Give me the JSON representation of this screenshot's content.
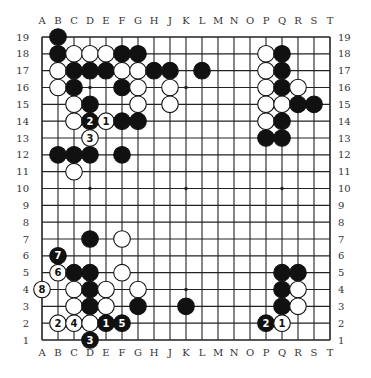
{
  "diagram": {
    "type": "go-board",
    "size": 19,
    "column_labels": [
      "A",
      "B",
      "C",
      "D",
      "E",
      "F",
      "G",
      "H",
      "J",
      "K",
      "L",
      "M",
      "N",
      "O",
      "P",
      "Q",
      "R",
      "S",
      "T"
    ],
    "row_labels": [
      "19",
      "18",
      "17",
      "16",
      "15",
      "14",
      "13",
      "12",
      "11",
      "10",
      "9",
      "8",
      "7",
      "6",
      "5",
      "4",
      "3",
      "2",
      "1"
    ],
    "star_points": [
      "D16",
      "K16",
      "Q16",
      "D10",
      "K10",
      "Q10",
      "D4",
      "K4",
      "Q4"
    ],
    "colors": {
      "black": "#111111",
      "white": "#ffffff",
      "line": "#222222",
      "background": "#ffffff"
    },
    "stones": [
      {
        "pt": "B19",
        "c": "B"
      },
      {
        "pt": "B18",
        "c": "B"
      },
      {
        "pt": "C18",
        "c": "W"
      },
      {
        "pt": "D18",
        "c": "W"
      },
      {
        "pt": "E18",
        "c": "W"
      },
      {
        "pt": "F18",
        "c": "B"
      },
      {
        "pt": "G18",
        "c": "B"
      },
      {
        "pt": "B17",
        "c": "W"
      },
      {
        "pt": "C17",
        "c": "B"
      },
      {
        "pt": "D17",
        "c": "B"
      },
      {
        "pt": "E17",
        "c": "B"
      },
      {
        "pt": "F17",
        "c": "W"
      },
      {
        "pt": "G17",
        "c": "W"
      },
      {
        "pt": "H17",
        "c": "B"
      },
      {
        "pt": "J17",
        "c": "B"
      },
      {
        "pt": "L17",
        "c": "B"
      },
      {
        "pt": "B16",
        "c": "W"
      },
      {
        "pt": "C16",
        "c": "B"
      },
      {
        "pt": "F16",
        "c": "B"
      },
      {
        "pt": "G16",
        "c": "W"
      },
      {
        "pt": "J16",
        "c": "W"
      },
      {
        "pt": "C15",
        "c": "W"
      },
      {
        "pt": "D15",
        "c": "B"
      },
      {
        "pt": "G15",
        "c": "W"
      },
      {
        "pt": "J15",
        "c": "W"
      },
      {
        "pt": "C14",
        "c": "W"
      },
      {
        "pt": "D14",
        "c": "B",
        "label": "2"
      },
      {
        "pt": "E14",
        "c": "W",
        "label": "1"
      },
      {
        "pt": "F14",
        "c": "B"
      },
      {
        "pt": "G14",
        "c": "B"
      },
      {
        "pt": "D13",
        "c": "W",
        "label": "3"
      },
      {
        "pt": "B12",
        "c": "B"
      },
      {
        "pt": "C12",
        "c": "B"
      },
      {
        "pt": "D12",
        "c": "B"
      },
      {
        "pt": "F12",
        "c": "B"
      },
      {
        "pt": "C11",
        "c": "W"
      },
      {
        "pt": "P18",
        "c": "W"
      },
      {
        "pt": "Q18",
        "c": "B"
      },
      {
        "pt": "P17",
        "c": "W"
      },
      {
        "pt": "Q17",
        "c": "B"
      },
      {
        "pt": "P16",
        "c": "W"
      },
      {
        "pt": "Q16",
        "c": "B"
      },
      {
        "pt": "R16",
        "c": "W"
      },
      {
        "pt": "P15",
        "c": "W"
      },
      {
        "pt": "Q15",
        "c": "W"
      },
      {
        "pt": "R15",
        "c": "B"
      },
      {
        "pt": "S15",
        "c": "B"
      },
      {
        "pt": "P14",
        "c": "W"
      },
      {
        "pt": "Q14",
        "c": "B"
      },
      {
        "pt": "P13",
        "c": "B"
      },
      {
        "pt": "Q13",
        "c": "B"
      },
      {
        "pt": "D7",
        "c": "B"
      },
      {
        "pt": "F7",
        "c": "W"
      },
      {
        "pt": "B6",
        "c": "B",
        "label": "7"
      },
      {
        "pt": "B5",
        "c": "W",
        "label": "6"
      },
      {
        "pt": "C5",
        "c": "B"
      },
      {
        "pt": "D5",
        "c": "B"
      },
      {
        "pt": "F5",
        "c": "W"
      },
      {
        "pt": "A4",
        "c": "W",
        "label": "8"
      },
      {
        "pt": "C4",
        "c": "W"
      },
      {
        "pt": "D4",
        "c": "B"
      },
      {
        "pt": "E4",
        "c": "W"
      },
      {
        "pt": "G4",
        "c": "W"
      },
      {
        "pt": "C3",
        "c": "W"
      },
      {
        "pt": "D3",
        "c": "B"
      },
      {
        "pt": "E3",
        "c": "W"
      },
      {
        "pt": "G3",
        "c": "B"
      },
      {
        "pt": "K3",
        "c": "B"
      },
      {
        "pt": "B2",
        "c": "W",
        "label": "2"
      },
      {
        "pt": "C2",
        "c": "W",
        "label": "4"
      },
      {
        "pt": "D2",
        "c": "W"
      },
      {
        "pt": "E2",
        "c": "B",
        "label": "1"
      },
      {
        "pt": "F2",
        "c": "B",
        "label": "5"
      },
      {
        "pt": "D1",
        "c": "B",
        "label": "3"
      },
      {
        "pt": "Q5",
        "c": "B"
      },
      {
        "pt": "R5",
        "c": "B"
      },
      {
        "pt": "Q4",
        "c": "B"
      },
      {
        "pt": "R4",
        "c": "W"
      },
      {
        "pt": "Q3",
        "c": "B"
      },
      {
        "pt": "R3",
        "c": "W"
      },
      {
        "pt": "P2",
        "c": "B",
        "label": "2"
      },
      {
        "pt": "Q2",
        "c": "W",
        "label": "1"
      }
    ]
  }
}
